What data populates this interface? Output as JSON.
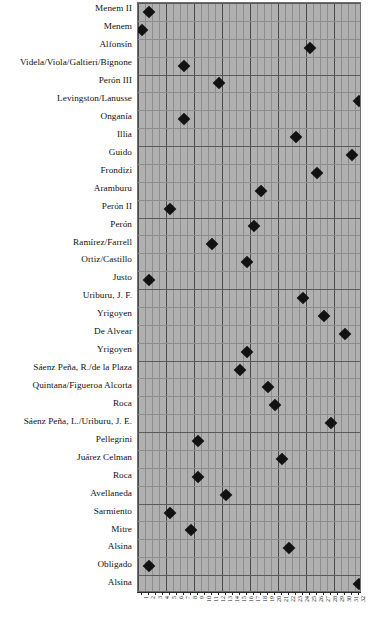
{
  "chart_data": {
    "type": "scatter",
    "title": "",
    "subtitle": "",
    "xlabel": "",
    "ylabel": "",
    "grid": true,
    "legend": null,
    "xlim": [
      0,
      32
    ],
    "categories": [
      "Menem II",
      "Menem",
      "Alfonsín",
      "Videla/Viola/Galtieri/Bignone",
      "Perón III",
      "Levingston/Lanusse",
      "Onganía",
      "Illia",
      "Guido",
      "Frondizi",
      "Aramburu",
      "Perón II",
      "Perón",
      "Ramírez/Farrell",
      "Ortiz/Castillo",
      "Justo",
      "Uriburu, J. F.",
      "Yrigoyen",
      "De Alvear",
      "Yrigoyen",
      "Sáenz Peña, R./de la Plaza",
      "Quintana/Figueroa Alcorta",
      "Roca",
      "Sáenz Peña, L./Uriburu, J. E.",
      "Pellegrini",
      "Juárez Celman",
      "Roca",
      "Avellaneda",
      "Sarmiento",
      "Mitre",
      "Alsina",
      "Obligado",
      "Alsina"
    ],
    "x_tick_labels": [
      "1",
      "2",
      "3",
      "4",
      "5",
      "6",
      "7",
      "8",
      "9",
      "10",
      "11",
      "12",
      "13",
      "14",
      "15",
      "16",
      "17",
      "18",
      "19",
      "20",
      "21",
      "22",
      "23",
      "24",
      "25",
      "26",
      "27",
      "28",
      "29",
      "30",
      "31",
      "32"
    ],
    "values": [
      2,
      1,
      25,
      7,
      12,
      32,
      7,
      23,
      31,
      26,
      18,
      5,
      17,
      11,
      16,
      2,
      24,
      27,
      30,
      16,
      15,
      19,
      20,
      28,
      9,
      21,
      9,
      13,
      5,
      8,
      22,
      2,
      32
    ],
    "points": [
      {
        "label": "Menem II",
        "x": 2,
        "row": 0
      },
      {
        "label": "Menem",
        "x": 1,
        "row": 1
      },
      {
        "label": "Alfonsín",
        "x": 25,
        "row": 2
      },
      {
        "label": "Videla/Viola/Galtieri/Bignone",
        "x": 7,
        "row": 3
      },
      {
        "label": "Perón III",
        "x": 12,
        "row": 4
      },
      {
        "label": "Levingston/Lanusse",
        "x": 32,
        "row": 5
      },
      {
        "label": "Onganía",
        "x": 7,
        "row": 6
      },
      {
        "label": "Illia",
        "x": 23,
        "row": 7
      },
      {
        "label": "Guido",
        "x": 31,
        "row": 8
      },
      {
        "label": "Frondizi",
        "x": 26,
        "row": 9
      },
      {
        "label": "Aramburu",
        "x": 18,
        "row": 10
      },
      {
        "label": "Perón II",
        "x": 5,
        "row": 11
      },
      {
        "label": "Perón",
        "x": 17,
        "row": 12
      },
      {
        "label": "Ramírez/Farrell",
        "x": 11,
        "row": 13
      },
      {
        "label": "Ortiz/Castillo",
        "x": 16,
        "row": 14
      },
      {
        "label": "Justo",
        "x": 2,
        "row": 15
      },
      {
        "label": "Uriburu, J. F.",
        "x": 24,
        "row": 16
      },
      {
        "label": "Yrigoyen",
        "x": 27,
        "row": 17
      },
      {
        "label": "De Alvear",
        "x": 30,
        "row": 18
      },
      {
        "label": "Yrigoyen",
        "x": 16,
        "row": 19
      },
      {
        "label": "Sáenz Peña, R./de la Plaza",
        "x": 15,
        "row": 20
      },
      {
        "label": "Quintana/Figueroa Alcorta",
        "x": 19,
        "row": 21
      },
      {
        "label": "Roca",
        "x": 20,
        "row": 22
      },
      {
        "label": "Sáenz Peña, L./Uriburu, J. E.",
        "x": 28,
        "row": 23
      },
      {
        "label": "Pellegrini",
        "x": 9,
        "row": 24
      },
      {
        "label": "Juárez Celman",
        "x": 21,
        "row": 25
      },
      {
        "label": "Roca",
        "x": 9,
        "row": 26
      },
      {
        "label": "Avellaneda",
        "x": 13,
        "row": 27
      },
      {
        "label": "Sarmiento",
        "x": 5,
        "row": 28
      },
      {
        "label": "Mitre",
        "x": 8,
        "row": 29
      },
      {
        "label": "Alsina",
        "x": 22,
        "row": 30
      },
      {
        "label": "Obligado",
        "x": 2,
        "row": 31
      },
      {
        "label": "Alsina",
        "x": 32,
        "row": 32
      }
    ],
    "colors": {
      "marker": "#121212",
      "plot_background": "#b0b0b0",
      "grid_minor": "#8d8d8d",
      "grid_major": "#4a4a4a",
      "axis": "#2b2b2b",
      "text": "#111111"
    }
  }
}
